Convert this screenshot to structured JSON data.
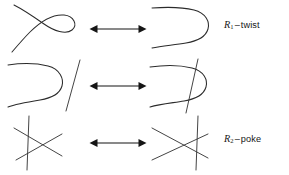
{
  "figure": {
    "background_color": "#ffffff",
    "stroke_color": "#2b2b2b",
    "arrow_color": "#151515",
    "text_color": "#161616",
    "width": 289,
    "height": 175
  },
  "rows": [
    {
      "id": "R1",
      "label": {
        "symbol": "R",
        "subscript": "1",
        "dash": "–",
        "name": "twist",
        "full_text": "R1 – twist"
      },
      "arrow": {
        "type": "double-headed-horizontal-arrow"
      },
      "left_diagram": {
        "name": "strand-with-twist-loop",
        "description": "single strand forming a loop with one self-crossing"
      },
      "right_diagram": {
        "name": "strand-untwisted-u-curve",
        "description": "single strand bent into a simple u-curve with no crossing"
      }
    },
    {
      "id": "R2",
      "label": {
        "symbol": "R",
        "subscript": "2",
        "dash": "–",
        "name": "poke",
        "full_text": "R2 – poke"
      },
      "arrow": {
        "type": "double-headed-horizontal-arrow"
      },
      "left_diagram": {
        "name": "u-curve-beside-separate-line",
        "description": "u-curve strand with a separate straight strand alongside, no crossings"
      },
      "right_diagram": {
        "name": "u-curve-poked-by-line",
        "description": "straight strand poked through the u-curve creating two crossings"
      }
    },
    {
      "id": "R3",
      "label": {
        "symbol": "R",
        "subscript": "3",
        "dash": "–",
        "name": "slide",
        "full_text": "R3 – slide"
      },
      "arrow": {
        "type": "double-headed-horizontal-arrow"
      },
      "left_diagram": {
        "name": "three-strands-vertical-left",
        "description": "three mutually crossing strands with the vertical strand left of the x-crossing"
      },
      "right_diagram": {
        "name": "three-strands-vertical-right",
        "description": "three mutually crossing strands with the vertical strand slid to the right of the x-crossing"
      }
    }
  ]
}
